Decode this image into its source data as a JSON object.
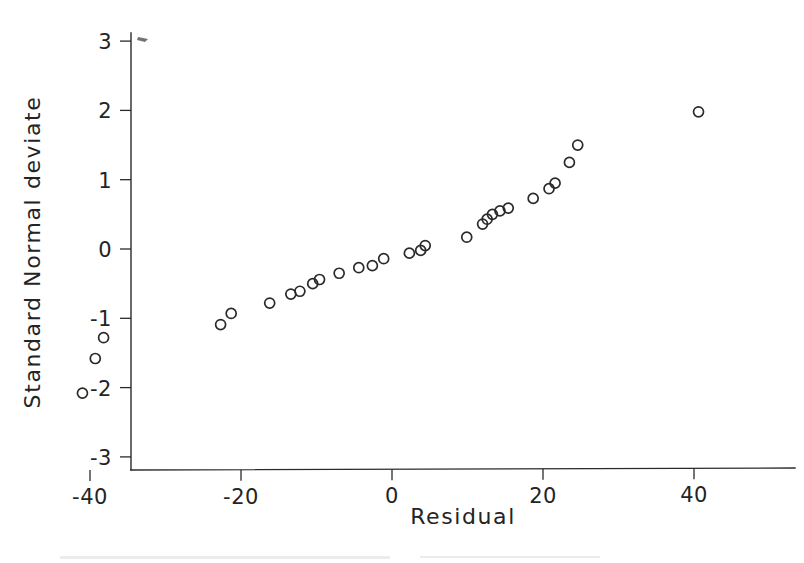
{
  "chart_data": {
    "type": "scatter",
    "title": "",
    "subtitle": "",
    "xlabel": "Residual",
    "ylabel": "Standard Normal deviate",
    "xlim": [
      -45,
      45
    ],
    "ylim": [
      -3.2,
      3.2
    ],
    "xticks": [
      -40,
      -20,
      0,
      20,
      40
    ],
    "xticklabels": [
      "-40",
      "-20",
      "0",
      "20",
      "40"
    ],
    "yticks": [
      -3,
      -2,
      -1,
      0,
      1,
      2,
      3
    ],
    "yticklabels": [
      "-3",
      "-2",
      "-1",
      "0",
      "1",
      "2",
      "3"
    ],
    "grid": false,
    "legend": null,
    "marker": "open-circle",
    "marker_size": 9,
    "series": [
      {
        "name": "Residual quantiles",
        "x": [
          -41.0,
          -39.3,
          -38.2,
          -22.7,
          -21.3,
          -16.2,
          -13.4,
          -12.2,
          -10.5,
          -9.6,
          -7.0,
          -4.4,
          -2.6,
          -1.1,
          2.3,
          3.8,
          4.4,
          9.9,
          12.0,
          12.6,
          13.3,
          14.3,
          15.4,
          18.7,
          20.8,
          21.6,
          23.5,
          24.6,
          40.6
        ],
        "y": [
          -2.08,
          -1.58,
          -1.28,
          -1.09,
          -0.93,
          -0.78,
          -0.65,
          -0.61,
          -0.5,
          -0.44,
          -0.35,
          -0.27,
          -0.24,
          -0.14,
          -0.06,
          -0.02,
          0.05,
          0.17,
          0.36,
          0.43,
          0.5,
          0.55,
          0.59,
          0.73,
          0.87,
          0.95,
          1.25,
          1.5,
          1.98
        ]
      }
    ]
  },
  "axes": {
    "x_axis_name": "residual-axis",
    "y_axis_name": "standard-normal-deviate-axis"
  },
  "artifacts": {
    "top_left_mark": "scan-speck"
  }
}
